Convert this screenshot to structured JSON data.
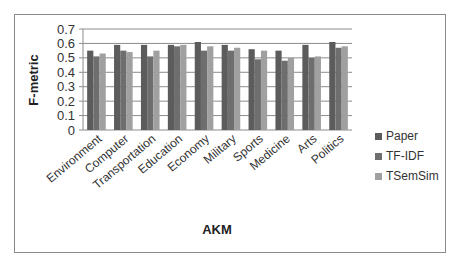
{
  "chart_data": {
    "type": "bar",
    "title": "",
    "xlabel": "AKM",
    "ylabel": "F-metric",
    "ylim": [
      0,
      0.7
    ],
    "yticks": [
      "0",
      "0.1",
      "0.2",
      "0.3",
      "0.4",
      "0.5",
      "0.6",
      "0.7"
    ],
    "grid": true,
    "legend_position": "right",
    "categories": [
      "Environment",
      "Computer",
      "Transportation",
      "Education",
      "Economy",
      "Military",
      "Sports",
      "Medicine",
      "Arts",
      "Politics"
    ],
    "series": [
      {
        "name": "Paper",
        "color": "#5c5c5c",
        "values": [
          0.55,
          0.59,
          0.59,
          0.59,
          0.61,
          0.59,
          0.56,
          0.55,
          0.59,
          0.61
        ]
      },
      {
        "name": "TF-IDF",
        "color": "#6e6e6e",
        "values": [
          0.51,
          0.55,
          0.51,
          0.58,
          0.55,
          0.55,
          0.49,
          0.48,
          0.5,
          0.57
        ]
      },
      {
        "name": "TSemSim",
        "color": "#a0a0a0",
        "values": [
          0.53,
          0.54,
          0.55,
          0.59,
          0.58,
          0.57,
          0.55,
          0.5,
          0.51,
          0.58
        ]
      }
    ]
  }
}
